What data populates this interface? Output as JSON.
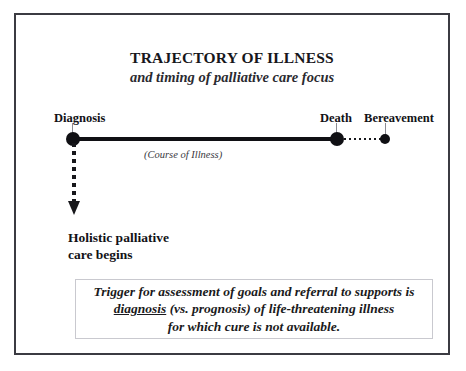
{
  "slide": {
    "title": "TRAJECTORY OF ILLNESS",
    "subtitle": "and timing of palliative care focus"
  },
  "timeline": {
    "caption": "(Course of Illness)",
    "points": [
      {
        "id": "diagnosis",
        "label": "Diagnosis"
      },
      {
        "id": "death",
        "label": "Death"
      },
      {
        "id": "bereavement",
        "label": "Bereavement"
      }
    ]
  },
  "palliative": {
    "line1": "Holistic palliative",
    "line2": "care begins"
  },
  "trigger_box": {
    "line1": "Trigger for assessment of goals and referral to supports is",
    "line2_underlined": "diagnosis",
    "line2_rest": " (vs. prognosis) of life-threatening illness",
    "line3": "for which cure is not available."
  },
  "chart_data": {
    "type": "line",
    "title": "TRAJECTORY OF ILLNESS",
    "subtitle": "and timing of palliative care focus",
    "xlabel": "(Course of Illness)",
    "ylabel": "",
    "grid": false,
    "legend": "none",
    "categories": [
      "Diagnosis",
      "Death",
      "Bereavement"
    ],
    "x": [
      0,
      1,
      1.19
    ],
    "values": [
      0,
      0,
      0
    ],
    "series": [
      {
        "name": "Course of Illness",
        "style": "solid",
        "x": [
          0,
          1
        ],
        "values": [
          0,
          0
        ]
      },
      {
        "name": "Bereavement",
        "style": "dotted",
        "x": [
          1,
          1.19
        ],
        "values": [
          0,
          0
        ]
      },
      {
        "name": "Holistic palliative care begins",
        "style": "dotted-arrow-down",
        "x": [
          0,
          0
        ],
        "values": [
          0,
          -0.3
        ]
      }
    ],
    "annotations": [
      {
        "text": "Diagnosis",
        "x": 0,
        "y": 0
      },
      {
        "text": "Death",
        "x": 1,
        "y": 0
      },
      {
        "text": "Bereavement",
        "x": 1.19,
        "y": 0
      },
      {
        "text": "(Course of Illness)",
        "x": 0.27,
        "y": -0.05
      },
      {
        "text": "Holistic palliative care begins",
        "x": 0,
        "y": -0.35
      },
      {
        "text": "Trigger for assessment of goals and referral to supports is diagnosis (vs. prognosis) of life-threatening illness for which cure is not available.",
        "x": 0.5,
        "y": -0.6
      }
    ]
  }
}
